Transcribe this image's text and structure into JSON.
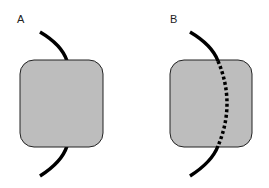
{
  "panels": [
    {
      "label": "A",
      "box": {
        "x": 20,
        "y": 60,
        "width": 83,
        "height": 87,
        "radius": 14,
        "fill": "#bdbdbd",
        "stroke": "#222222"
      },
      "curve": {
        "style": "solid-over-box-hidden",
        "color": "#000000"
      }
    },
    {
      "label": "B",
      "box": {
        "x": 170,
        "y": 60,
        "width": 82,
        "height": 87,
        "radius": 14,
        "fill": "#bdbdbd",
        "stroke": "#222222"
      },
      "curve": {
        "style": "solid-outside-dotted-inside",
        "color": "#000000"
      }
    }
  ],
  "colors": {
    "background": "#ffffff",
    "box_fill": "#bdbdbd",
    "line": "#000000"
  }
}
